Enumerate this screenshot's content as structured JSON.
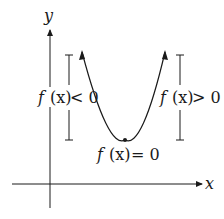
{
  "diagram": {
    "axes": {
      "x_label": "x",
      "y_label": "y"
    },
    "labels": {
      "left": {
        "f": "f",
        "arg": "(x)",
        "rel": "< 0"
      },
      "right": {
        "f": "f",
        "arg": "(x)",
        "rel": "> 0"
      },
      "vertex": {
        "f": "f",
        "arg": "(x)",
        "rel": "= 0"
      }
    },
    "colors": {
      "stroke": "#1a1a1a",
      "background": "#ffffff"
    }
  }
}
